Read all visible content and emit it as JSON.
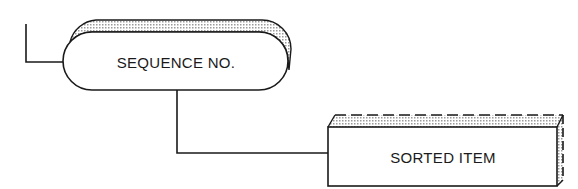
{
  "diagram": {
    "nodes": [
      {
        "id": "sequence-no",
        "label": "SEQUENCE NO.",
        "shape": "rounded-pill-3d"
      },
      {
        "id": "sorted-item",
        "label": "SORTED ITEM",
        "shape": "box-3d-dashed-top"
      }
    ],
    "edges": [
      {
        "from": "external-left",
        "to": "sequence-no"
      },
      {
        "from": "sequence-no",
        "to": "sorted-item"
      }
    ],
    "colors": {
      "stroke": "#1a1a1a",
      "shading": "#d9d9d9",
      "background": "#ffffff"
    }
  }
}
